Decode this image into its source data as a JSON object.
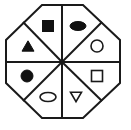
{
  "figure": {
    "name": "octagon-eight-sector-shape-diagram",
    "background_color": "#ffffff",
    "line_color": "#1a1a1a",
    "fill_color": "#111111",
    "outer_shape": "octagon",
    "sector_count": 8,
    "center": {
      "x": 62,
      "y": 62
    },
    "octagon_vertices": [
      {
        "x": 42,
        "y": 5
      },
      {
        "x": 83,
        "y": 5
      },
      {
        "x": 120,
        "y": 40
      },
      {
        "x": 120,
        "y": 83
      },
      {
        "x": 83,
        "y": 118
      },
      {
        "x": 42,
        "y": 118
      },
      {
        "x": 6,
        "y": 83
      },
      {
        "x": 6,
        "y": 40
      }
    ],
    "divider_endpoints": [
      {
        "x": 62,
        "y": 5
      },
      {
        "x": 102,
        "y": 22
      },
      {
        "x": 120,
        "y": 62
      },
      {
        "x": 102,
        "y": 101
      },
      {
        "x": 62,
        "y": 118
      },
      {
        "x": 23,
        "y": 101
      },
      {
        "x": 6,
        "y": 62
      },
      {
        "x": 23,
        "y": 22
      }
    ],
    "sectors": [
      {
        "position": "top-left",
        "shape": "square",
        "fill": "filled",
        "cx": 48,
        "cy": 26,
        "size": 11
      },
      {
        "position": "top-right",
        "shape": "ellipse",
        "fill": "filled",
        "cx": 78,
        "cy": 26,
        "rx": 8,
        "ry": 4.5
      },
      {
        "position": "right-upper",
        "shape": "circle",
        "fill": "outline",
        "cx": 97,
        "cy": 46,
        "r": 6
      },
      {
        "position": "right-lower",
        "shape": "square",
        "fill": "outline",
        "cx": 97,
        "cy": 76,
        "size": 11
      },
      {
        "position": "bottom-right",
        "shape": "triangle-down",
        "fill": "outline",
        "cx": 76,
        "cy": 97,
        "size": 11
      },
      {
        "position": "bottom-left",
        "shape": "ellipse",
        "fill": "outline",
        "cx": 48,
        "cy": 97,
        "rx": 8,
        "ry": 4.5
      },
      {
        "position": "left-lower",
        "shape": "circle",
        "fill": "filled",
        "cx": 27,
        "cy": 76,
        "r": 6
      },
      {
        "position": "left-upper",
        "shape": "triangle-up",
        "fill": "filled",
        "cx": 28,
        "cy": 46,
        "size": 12
      }
    ]
  }
}
